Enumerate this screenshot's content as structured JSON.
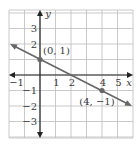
{
  "chart_data": {
    "type": "line",
    "title": "",
    "xlabel": "x",
    "ylabel": "y",
    "xlim": [
      -2,
      6
    ],
    "ylim": [
      -4,
      4.2
    ],
    "grid": true,
    "x_ticks": [
      "-1",
      "1",
      "2",
      "4",
      "5"
    ],
    "y_ticks": [
      "3",
      "2",
      "-1",
      "-2",
      "-3"
    ],
    "series": [
      {
        "name": "line",
        "equation": "y = -1/2 x + 1",
        "x": [
          -2,
          0,
          2,
          4,
          6
        ],
        "y": [
          2,
          1,
          0,
          -1,
          -2
        ],
        "color": "#666666"
      }
    ],
    "points": [
      {
        "x": 0,
        "y": 1,
        "label": "(0, 1)"
      },
      {
        "x": 4,
        "y": -1,
        "label": "(4, −1)"
      }
    ],
    "annotations": [
      "(0, 1)",
      "(4, −1)"
    ]
  },
  "colors": {
    "grid": "#bdbdbd",
    "axis": "#222222",
    "line": "#666666",
    "text": "#3a3a3a"
  }
}
